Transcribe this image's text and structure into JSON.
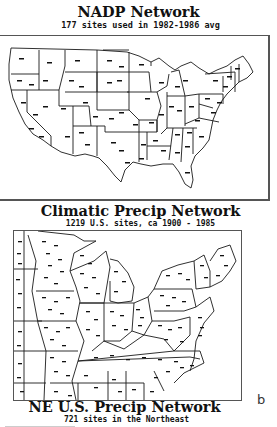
{
  "panels": [
    {
      "id": "nadp",
      "title": "NADP Network",
      "subtitle": "177 sites used in 1982-1986 avg",
      "site_count": 177,
      "period": "1982-1986 avg"
    },
    {
      "id": "climatic",
      "title": "Climatic Precip Network",
      "subtitle": "1219 U.S. sites, ca 1900 - 1985",
      "site_count": 1219,
      "period": "ca 1900 - 1985"
    },
    {
      "id": "ne",
      "title": "NE U.S. Precip Network",
      "subtitle": "721 sites in the Northeast",
      "site_count": 721,
      "region": "Northeast"
    }
  ],
  "panel_letter": "b",
  "colors": {
    "ink": "#111111",
    "frame": "#555555",
    "background": "#ffffff"
  }
}
